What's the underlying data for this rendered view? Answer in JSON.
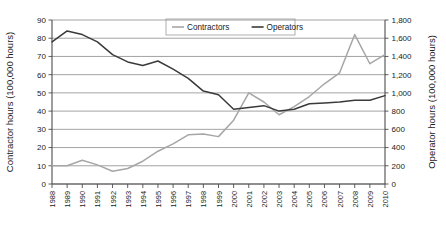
{
  "chart_data": {
    "type": "line",
    "title": "",
    "xlabel": "",
    "ylabel": "Contractor hours (100,000 hours)",
    "y2label": "Operator hours (100,000 hours)",
    "grid": true,
    "legend_position": "top-center-inside",
    "ylim": [
      0,
      90
    ],
    "y2lim": [
      0,
      1800
    ],
    "ytick_step": 10,
    "y2tick_step": 200,
    "categories": [
      "1988",
      "1989",
      "1990",
      "1991",
      "1992",
      "1993",
      "1994",
      "1995",
      "1996",
      "1997",
      "1998",
      "1999",
      "2000",
      "2001",
      "2002",
      "2003",
      "2004",
      "2005",
      "2006",
      "2007",
      "2008",
      "2009",
      "2010"
    ],
    "ytick_labels": [
      "0",
      "10",
      "20",
      "30",
      "40",
      "50",
      "60",
      "70",
      "80",
      "90"
    ],
    "y2tick_labels": [
      "0",
      "200",
      "400",
      "600",
      "800",
      "1,000",
      "1,200",
      "1,400",
      "1,600",
      "1,800"
    ],
    "series": [
      {
        "name": "Contractors",
        "axis": "left",
        "color": "#a6a6a6",
        "values": [
          10,
          10,
          13,
          10.5,
          7,
          8.5,
          12.5,
          18,
          22,
          27,
          27.5,
          26,
          35,
          50,
          45,
          38,
          42.5,
          48,
          55,
          61,
          82,
          66,
          71
        ]
      },
      {
        "name": "Operators",
        "axis": "right",
        "color": "#3a3a3a",
        "values": [
          1560,
          1680,
          1640,
          1560,
          1420,
          1340,
          1300,
          1350,
          1260,
          1160,
          1020,
          980,
          820,
          840,
          860,
          800,
          820,
          880,
          890,
          900,
          920,
          920,
          970
        ]
      }
    ],
    "legend": [
      {
        "label": "Contractors",
        "color": "#a6a6a6"
      },
      {
        "label": "Operators",
        "color": "#3a3a3a"
      }
    ]
  }
}
